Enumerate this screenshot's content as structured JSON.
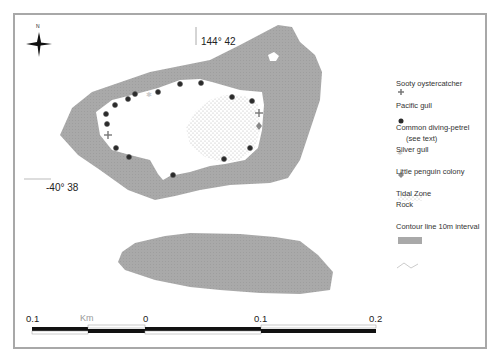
{
  "map": {
    "north_label": "N",
    "longitude_label": "144° 42",
    "latitude_label": "-40° 38",
    "colors": {
      "rock": "#a9a9a9",
      "frame": "#a8a8a8",
      "pacific_gull": "#2a2a2a",
      "sooty_oystercatcher": "#7a7a7a",
      "diving_petrel": "#d4d4d4",
      "silver_gull": "#8a8a8a",
      "penguin_dots": "#b5b5b5"
    }
  },
  "legend": {
    "items": [
      {
        "label": "Sooty oystercatcher",
        "symbol": "plus-icon"
      },
      {
        "label": "Pacific gull",
        "symbol": "filled-circle-icon"
      },
      {
        "label": "Common diving-petrel",
        "symbol": "star-icon",
        "sublabel": "(see text)"
      },
      {
        "label": "Silver gull",
        "symbol": "diamond-icon"
      },
      {
        "label": "Little penguin colony",
        "symbol": "dot-pattern-icon"
      },
      {
        "label": "Tidal Zone",
        "symbol": "none"
      },
      {
        "label": "Rock",
        "symbol": "grey-fill-icon"
      },
      {
        "label": "Contour line 10m interval",
        "symbol": "zigzag-line-icon"
      }
    ]
  },
  "scalebar": {
    "labels": [
      "0.1",
      "0",
      "0.1",
      "0.2"
    ],
    "unit": "Km"
  }
}
